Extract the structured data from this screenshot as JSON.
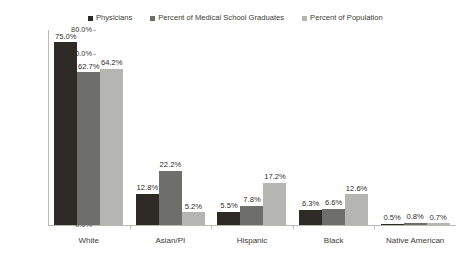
{
  "chart_data": {
    "type": "bar",
    "title": "",
    "xlabel": "",
    "ylabel": "",
    "ylim": [
      0,
      80
    ],
    "ytick_labels": [
      "80.0%",
      "70.0%",
      "60.0%",
      "50.0%",
      "40.0%",
      "30.0%",
      "20.0%",
      "10.0%",
      "0.0%"
    ],
    "ytick_values": [
      80,
      70,
      60,
      50,
      40,
      30,
      20,
      10,
      0
    ],
    "grid": false,
    "legend_position": "top",
    "categories": [
      "White",
      "Asian/PI",
      "Hispanic",
      "Black",
      "Native American"
    ],
    "series": [
      {
        "name": "Physicians",
        "color": "#2e2b26",
        "values": [
          75.0,
          12.8,
          5.5,
          6.3,
          0.5
        ],
        "labels": [
          "75.0%",
          "12.8%",
          "5.5%",
          "6.3%",
          "0.5%"
        ]
      },
      {
        "name": "Percent of Medical School Graduates",
        "color": "#6e6e6a",
        "values": [
          62.7,
          22.2,
          7.8,
          6.6,
          0.8
        ],
        "labels": [
          "62.7%",
          "22.2%",
          "7.8%",
          "6.6%",
          "0.8%"
        ]
      },
      {
        "name": "Percent of Population",
        "color": "#b5b5b2",
        "values": [
          64.2,
          5.2,
          17.2,
          12.6,
          0.7
        ],
        "labels": [
          "64.2%",
          "5.2%",
          "17.2%",
          "12.6%",
          "0.7%"
        ]
      }
    ]
  }
}
